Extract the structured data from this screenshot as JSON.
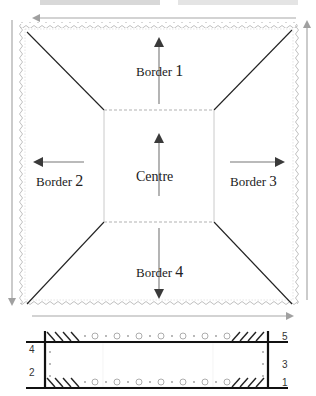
{
  "title_partial": "Border Numbers — Border Names",
  "main_diagram": {
    "regions": [
      {
        "id": "border1",
        "label": "Border",
        "number": "1",
        "arrow": "up"
      },
      {
        "id": "border2",
        "label": "Border",
        "number": "2",
        "arrow": "left"
      },
      {
        "id": "border3",
        "label": "Border",
        "number": "3",
        "arrow": "right"
      },
      {
        "id": "border4",
        "label": "Border",
        "number": "4",
        "arrow": "down"
      },
      {
        "id": "centre",
        "label": "Centre",
        "arrow": "up"
      }
    ],
    "outer_arrows": [
      "top-left",
      "right-up",
      "left-down",
      "bottom-right"
    ]
  },
  "strip_diagram": {
    "left_labels": [
      "4",
      "2"
    ],
    "right_labels": [
      "5",
      "3",
      "1"
    ]
  },
  "colors": {
    "line": "#222222",
    "arrow_dark": "#3a3a3a",
    "arrow_gray": "#9a9a9a",
    "wave": "#b8b8b8",
    "dashed": "#a8a8a8"
  }
}
